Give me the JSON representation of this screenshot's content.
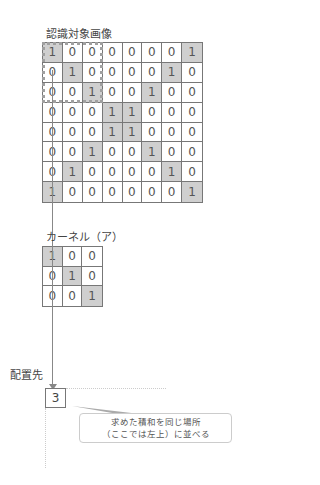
{
  "image_label": "認識対象画像",
  "image_matrix": [
    [
      1,
      0,
      0,
      0,
      0,
      0,
      0,
      1
    ],
    [
      0,
      1,
      0,
      0,
      0,
      0,
      1,
      0
    ],
    [
      0,
      0,
      1,
      0,
      0,
      1,
      0,
      0
    ],
    [
      0,
      0,
      0,
      1,
      1,
      0,
      0,
      0
    ],
    [
      0,
      0,
      0,
      1,
      1,
      0,
      0,
      0
    ],
    [
      0,
      0,
      1,
      0,
      0,
      1,
      0,
      0
    ],
    [
      0,
      1,
      0,
      0,
      0,
      0,
      1,
      0
    ],
    [
      1,
      0,
      0,
      0,
      0,
      0,
      0,
      1
    ]
  ],
  "kernel_label": "カーネル（ア）",
  "kernel_matrix": [
    [
      1,
      0,
      0
    ],
    [
      0,
      1,
      0
    ],
    [
      0,
      0,
      1
    ]
  ],
  "placement_label": "配置先",
  "result_value": "3",
  "callout": {
    "line1": "求めた積和を同じ場所",
    "line2": "（ここでは左上）に並べる"
  },
  "colors": {
    "highlight": "#cfcfcf",
    "border": "#777777",
    "window_dotted": "#a0a0a0"
  }
}
